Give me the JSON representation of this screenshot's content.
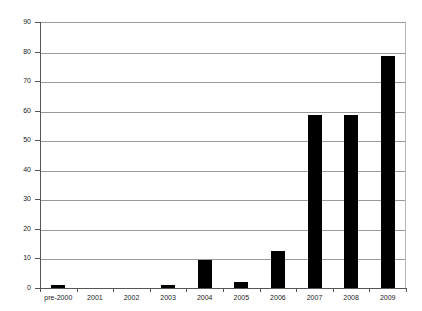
{
  "chart_data": {
    "type": "bar",
    "title": "",
    "subtitle": "",
    "xlabel": "",
    "ylabel": "",
    "categories": [
      "pre-2000",
      "2001",
      "2002",
      "2003",
      "2004",
      "2005",
      "2006",
      "2007",
      "2008",
      "2009"
    ],
    "values": [
      1,
      0,
      0,
      1,
      9.5,
      2,
      12.5,
      58.5,
      58.5,
      78.5
    ],
    "ylim": [
      0,
      90
    ],
    "y_ticks": [
      0,
      10,
      20,
      30,
      40,
      50,
      60,
      70,
      80,
      90
    ],
    "y_tick_labels": [
      "0",
      "10",
      "20",
      "30",
      "40",
      "50",
      "60",
      "70",
      "80",
      "90"
    ],
    "grid": true,
    "grid_axis": "y",
    "legend": false,
    "legend_position": "none",
    "annotations": [],
    "colors": {
      "bar": "#000000",
      "gridline": "#9a9a9a",
      "axis": "#555555",
      "background": "#ffffff",
      "text": "#1a1a1a"
    }
  }
}
